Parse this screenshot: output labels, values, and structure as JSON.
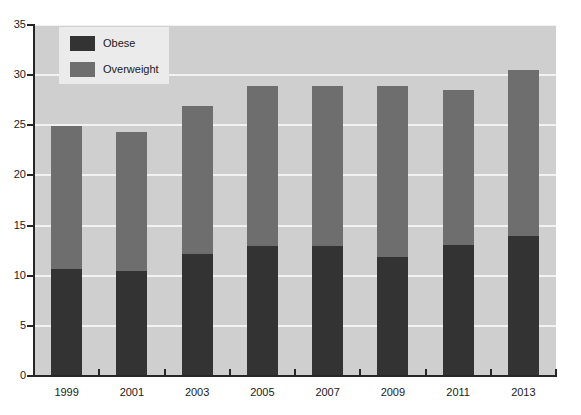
{
  "chart_data": {
    "type": "bar",
    "subtype": "stacked-vertical",
    "title": "",
    "subtitle": "",
    "xlabel": "",
    "ylabel": "",
    "categories": [
      "1999",
      "2001",
      "2003",
      "2005",
      "2007",
      "2009",
      "2011",
      "2013"
    ],
    "series": [
      {
        "name": "Obese",
        "color": "#333333",
        "values": [
          10.7,
          10.5,
          12.2,
          13.0,
          13.0,
          11.9,
          13.1,
          14.0
        ]
      },
      {
        "name": "Overweight",
        "color": "#6e6e6e",
        "values": [
          14.2,
          13.8,
          14.7,
          15.9,
          15.9,
          17.0,
          15.4,
          16.5
        ]
      }
    ],
    "totals": [
      24.9,
      24.3,
      26.9,
      28.9,
      28.9,
      28.9,
      28.5,
      30.5
    ],
    "ylim": [
      0,
      35
    ],
    "ytick_values": [
      0,
      5,
      10,
      15,
      20,
      25,
      30,
      35
    ],
    "ytick_labels": [
      "0",
      "5",
      "10",
      "15",
      "20",
      "25",
      "30",
      "35"
    ],
    "grid": true,
    "grid_axis": "y",
    "grid_color": "#f2f2f2",
    "plot_background": "#cfcfcf",
    "figure_background": "#ffffff",
    "legend_position": "upper left",
    "legend_background": "#ebebeb",
    "legend_entries": [
      "Obese",
      "Overweight"
    ]
  },
  "legend": {
    "items": [
      {
        "label": "Obese",
        "color": "#333333"
      },
      {
        "label": "Overweight",
        "color": "#6e6e6e"
      }
    ]
  },
  "axes": {
    "y": {
      "labels": [
        "35",
        "30",
        "25",
        "20",
        "15",
        "10",
        "5",
        "0"
      ]
    },
    "x": {
      "labels": [
        "1999",
        "2001",
        "2003",
        "2005",
        "2007",
        "2009",
        "2011",
        "2013"
      ]
    }
  }
}
